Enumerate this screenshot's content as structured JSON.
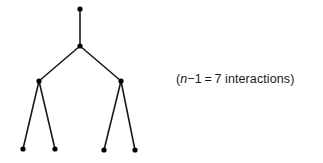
{
  "diagram": {
    "type": "binary-tree",
    "stroke_color": "#1a1a1a",
    "node_color": "#000000",
    "nodes": [
      {
        "id": "root",
        "x": 80,
        "y": 9
      },
      {
        "id": "n1",
        "x": 80,
        "y": 46
      },
      {
        "id": "left",
        "x": 39,
        "y": 81
      },
      {
        "id": "right",
        "x": 121,
        "y": 81
      },
      {
        "id": "leaf1",
        "x": 23,
        "y": 149
      },
      {
        "id": "leaf2",
        "x": 55,
        "y": 149
      },
      {
        "id": "leaf3",
        "x": 104,
        "y": 150
      },
      {
        "id": "leaf4",
        "x": 135,
        "y": 150
      }
    ],
    "edges": [
      [
        "root",
        "n1"
      ],
      [
        "n1",
        "left"
      ],
      [
        "n1",
        "right"
      ],
      [
        "left",
        "leaf1"
      ],
      [
        "left",
        "leaf2"
      ],
      [
        "right",
        "leaf3"
      ],
      [
        "right",
        "leaf4"
      ]
    ]
  },
  "caption": {
    "open_paren": "(",
    "variable": "n",
    "expression": "−1 = 7 interactions)"
  }
}
